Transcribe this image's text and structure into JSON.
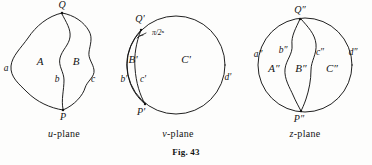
{
  "figure": {
    "caption": "Fig. 43",
    "panels": [
      {
        "id": "u-plane",
        "caption_symbol": "u",
        "caption_suffix": "-plane",
        "point_labels": [
          {
            "name": "point-Q",
            "text": "Q"
          },
          {
            "name": "point-P",
            "text": "P"
          }
        ],
        "boundary_labels": [
          {
            "name": "arc-label-a",
            "text": "a"
          },
          {
            "name": "arc-label-b",
            "text": "b"
          },
          {
            "name": "arc-label-c",
            "text": "c"
          }
        ],
        "region_labels": [
          {
            "name": "region-A",
            "text": "A"
          },
          {
            "name": "region-B",
            "text": "B"
          }
        ]
      },
      {
        "id": "v-plane",
        "caption_symbol": "v",
        "caption_suffix": "-plane",
        "point_labels": [
          {
            "name": "point-Q-prime",
            "text": "Q'"
          },
          {
            "name": "point-P-prime",
            "text": "P'"
          }
        ],
        "boundary_labels": [
          {
            "name": "arc-label-b-prime",
            "text": "b'"
          },
          {
            "name": "arc-label-c-prime",
            "text": "c'"
          },
          {
            "name": "arc-label-d-prime",
            "text": "d'"
          }
        ],
        "region_labels": [
          {
            "name": "region-B-prime",
            "text": "B'"
          },
          {
            "name": "region-C-prime",
            "text": "C'"
          }
        ],
        "angle_annotation": "π/2ⁿ"
      },
      {
        "id": "z-plane",
        "caption_symbol": "z",
        "caption_suffix": "-plane",
        "point_labels": [
          {
            "name": "point-Q-double-prime",
            "text": "Q″"
          },
          {
            "name": "point-P-double-prime",
            "text": "P″"
          }
        ],
        "boundary_labels": [
          {
            "name": "arc-label-a-double-prime",
            "text": "a″"
          },
          {
            "name": "arc-label-b-double-prime",
            "text": "b″"
          },
          {
            "name": "arc-label-c-double-prime",
            "text": "c″"
          },
          {
            "name": "arc-label-d-double-prime",
            "text": "d″"
          }
        ],
        "region_labels": [
          {
            "name": "region-A-double-prime",
            "text": "A″"
          },
          {
            "name": "region-B-double-prime",
            "text": "B″"
          },
          {
            "name": "region-C-double-prime",
            "text": "C″"
          }
        ]
      }
    ],
    "colors": {
      "ink": "#141414",
      "paper": "#fdfdfc"
    }
  }
}
